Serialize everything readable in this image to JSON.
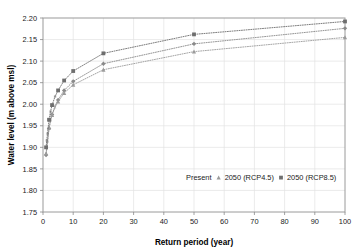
{
  "chart_data": {
    "type": "line",
    "title": "",
    "xlabel": "Return period (year)",
    "ylabel": "Water level (m above msl)",
    "xlim": [
      0,
      100
    ],
    "ylim": [
      1.75,
      2.2
    ],
    "xticks": [
      0,
      10,
      20,
      30,
      40,
      50,
      60,
      70,
      80,
      90,
      100
    ],
    "yticks": [
      1.75,
      1.8,
      1.85,
      1.9,
      1.95,
      2.0,
      2.05,
      2.1,
      2.15,
      2.2
    ],
    "xtick_labels": [
      "0",
      "10",
      "20",
      "30",
      "40",
      "50",
      "60",
      "70",
      "80",
      "90",
      "100"
    ],
    "ytick_labels": [
      "1.75",
      "1.80",
      "1.85",
      "1.90",
      "1.95",
      "2.00",
      "2.05",
      "2.10",
      "2.15",
      "2.20"
    ],
    "grid": true,
    "legend_position": "inside-bottom-right",
    "x": [
      1.02,
      1.25,
      1.5,
      2,
      2.5,
      3,
      4,
      5,
      7,
      10,
      20,
      50,
      100
    ],
    "series": [
      {
        "name": "Present",
        "marker": "diamond",
        "color": "#8a8a8a",
        "values": [
          1.882,
          1.897,
          1.912,
          1.944,
          1.962,
          1.976,
          1.996,
          2.01,
          2.032,
          2.053,
          2.094,
          2.14,
          2.176
        ]
      },
      {
        "name": "2050 (RCP4.5)",
        "marker": "triangle",
        "color": "#9b9b9b",
        "values": [
          1.886,
          1.9,
          1.915,
          1.945,
          1.962,
          1.975,
          1.993,
          2.006,
          2.026,
          2.045,
          2.08,
          2.122,
          2.155
        ]
      },
      {
        "name": "2050 (RCP8.5)",
        "marker": "square",
        "color": "#6e6e6e",
        "values": [
          1.9,
          1.916,
          1.932,
          1.964,
          1.983,
          1.998,
          2.018,
          2.032,
          2.055,
          2.077,
          2.118,
          2.162,
          2.192
        ]
      }
    ]
  },
  "legend": {
    "items": [
      {
        "label": "Present",
        "marker": "diamond-marker",
        "color": "#8a8a8a"
      },
      {
        "label": "2050 (RCP4.5)",
        "marker": "triangle-marker",
        "color": "#9b9b9b"
      },
      {
        "label": "2050 (RCP8.5)",
        "marker": "square-marker",
        "color": "#6e6e6e"
      }
    ]
  }
}
